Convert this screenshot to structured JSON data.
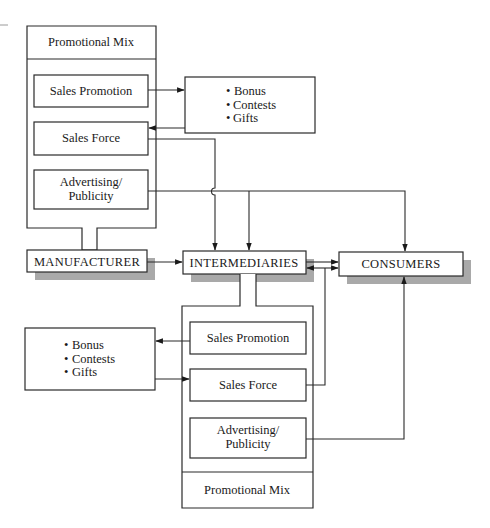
{
  "diagram": {
    "top_mix": {
      "title": "Promotional Mix",
      "items": [
        "Sales Promotion",
        "Sales Force",
        "Advertising/",
        "Publicity"
      ]
    },
    "top_incentives": {
      "bullets": [
        "Bonus",
        "Contests",
        "Gifts"
      ],
      "bullet_glyph": "•"
    },
    "nodes": {
      "manufacturer": "MANUFACTURER",
      "intermediaries": "INTERMEDIARIES",
      "consumers": "CONSUMERS"
    },
    "bottom_mix": {
      "title": "Promotional Mix",
      "items": [
        "Sales Promotion",
        "Sales Force",
        "Advertising/",
        "Publicity"
      ]
    },
    "bottom_incentives": {
      "bullets": [
        "Bonus",
        "Contests",
        "Gifts"
      ],
      "bullet_glyph": "•"
    },
    "colors": {
      "stroke": "#2a2a2a",
      "shadow": "#a9a9a9",
      "background": "#ffffff"
    }
  }
}
